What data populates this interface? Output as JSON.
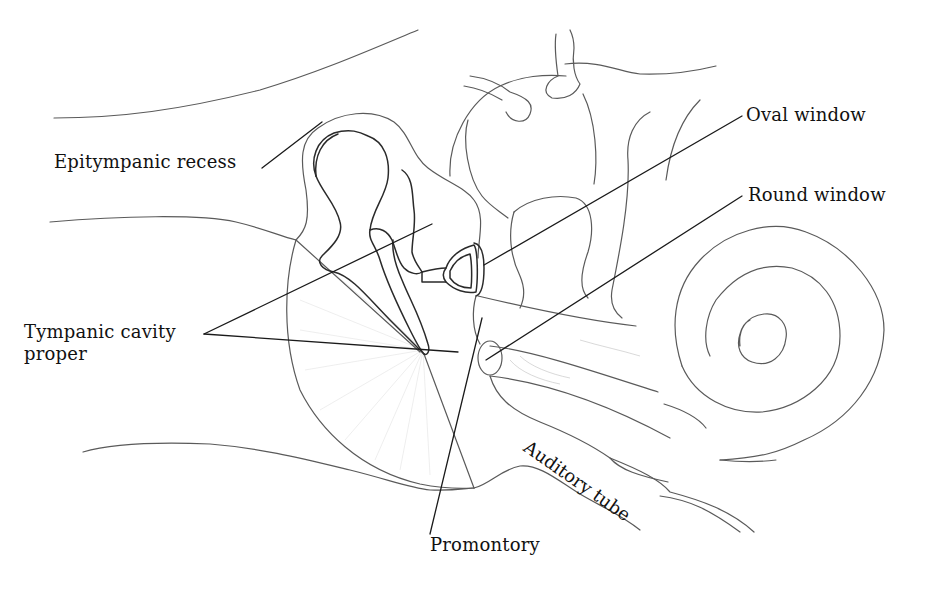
{
  "figure": {
    "colors": {
      "background": "#ffffff",
      "line": "#5a5a5a",
      "leader": "#1a1a1a",
      "text": "#111111"
    }
  },
  "labels": {
    "epitympanic_recess": "Epitympanic recess",
    "tympanic_cavity_line1": "Tympanic cavity",
    "tympanic_cavity_line2": "proper",
    "oval_window": "Oval window",
    "round_window": "Round window",
    "auditory_tube": "Auditory tube",
    "promontory": "Promontory"
  }
}
